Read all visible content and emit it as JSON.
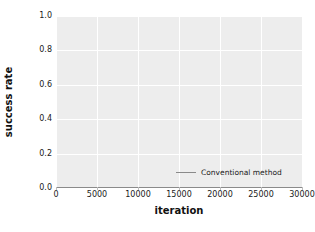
{
  "chart_data": {
    "type": "line",
    "title": "",
    "xlabel": "iteration",
    "ylabel": "success rate",
    "xlim": [
      0,
      30000
    ],
    "ylim": [
      0.0,
      1.0
    ],
    "grid": true,
    "grid_color": "#ffffff",
    "plot_background": "#ededed",
    "figure_background": "#ffffff",
    "legend_position": "lower right",
    "xticks": [
      0,
      5000,
      10000,
      15000,
      20000,
      25000,
      30000
    ],
    "xtick_labels": [
      "0",
      "5000",
      "10000",
      "15000",
      "20000",
      "25000",
      "30000"
    ],
    "yticks": [
      0.0,
      0.2,
      0.4,
      0.6,
      0.8,
      1.0
    ],
    "ytick_labels": [
      "0.0",
      "0.2",
      "0.4",
      "0.6",
      "0.8",
      "1.0"
    ],
    "series": [
      {
        "name": "Conventional method",
        "color": "#8a8a8a",
        "x": [
          0,
          5000,
          10000,
          15000,
          20000,
          25000,
          30000
        ],
        "values": [
          0.0,
          0.0,
          0.0,
          0.0,
          0.0,
          0.0,
          0.0
        ]
      }
    ],
    "legend_entries": [
      "Conventional method"
    ]
  }
}
